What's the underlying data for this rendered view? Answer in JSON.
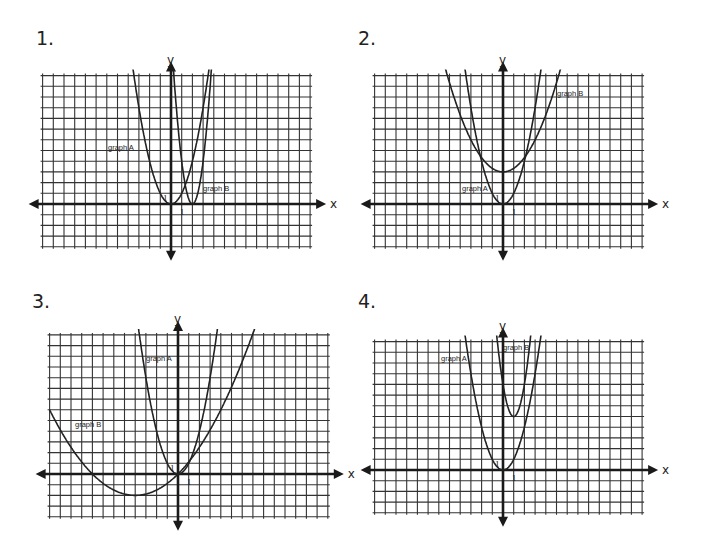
{
  "problems": [
    {
      "number": "1.",
      "x_axis_label": "x",
      "y_axis_label": "y",
      "tick_label_x": "1",
      "tick_label_y": "1",
      "graph_a_label": "graph A",
      "graph_b_label": "graph B"
    },
    {
      "number": "2.",
      "x_axis_label": "x",
      "y_axis_label": "y",
      "tick_label_x": "1",
      "tick_label_y": "1",
      "graph_a_label": "graph A",
      "graph_b_label": "graph B"
    },
    {
      "number": "3.",
      "x_axis_label": "x",
      "y_axis_label": "y",
      "tick_label_x": "1",
      "tick_label_y": "1",
      "graph_a_label": "graph A",
      "graph_b_label": "graph B"
    },
    {
      "number": "4.",
      "x_axis_label": "x",
      "y_axis_label": "y",
      "tick_label_x": "1",
      "tick_label_y": "1",
      "graph_a_label": "graph A",
      "graph_b_label": "graph B"
    }
  ],
  "chart_data": [
    {
      "type": "line",
      "title": "1.",
      "xlabel": "x",
      "ylabel": "y",
      "grid": true,
      "xlim": [
        -12,
        13
      ],
      "ylim": [
        -4,
        12
      ],
      "series": [
        {
          "name": "graph A",
          "equation": "y = x^2",
          "vertex": [
            0,
            0
          ]
        },
        {
          "name": "graph B",
          "equation": "y = 4(x-2)^2",
          "vertex": [
            2,
            0
          ]
        }
      ]
    },
    {
      "type": "line",
      "title": "2.",
      "xlabel": "x",
      "ylabel": "y",
      "grid": true,
      "xlim": [
        -12,
        13
      ],
      "ylim": [
        -4,
        12
      ],
      "series": [
        {
          "name": "graph A",
          "equation": "y = x^2",
          "vertex": [
            0,
            0
          ]
        },
        {
          "name": "graph B",
          "equation": "y = 0.33x^2 + 3",
          "vertex": [
            0,
            3
          ]
        }
      ]
    },
    {
      "type": "line",
      "title": "3.",
      "xlabel": "x",
      "ylabel": "y",
      "grid": true,
      "xlim": [
        -12,
        14
      ],
      "ylim": [
        -4,
        13
      ],
      "series": [
        {
          "name": "graph A",
          "equation": "y = x^2",
          "vertex": [
            0,
            0
          ]
        },
        {
          "name": "graph B",
          "equation": "y = 0.125(x+4)^2 - 2",
          "vertex": [
            -4,
            -2
          ]
        }
      ]
    },
    {
      "type": "line",
      "title": "4.",
      "xlabel": "x",
      "ylabel": "y",
      "grid": true,
      "xlim": [
        -12,
        13
      ],
      "ylim": [
        -4,
        12
      ],
      "series": [
        {
          "name": "graph A",
          "equation": "y = x^2",
          "vertex": [
            0,
            0
          ]
        },
        {
          "name": "graph B",
          "equation": "y = 3(x-1)^2 + 5",
          "vertex": [
            1,
            5
          ]
        }
      ]
    }
  ]
}
